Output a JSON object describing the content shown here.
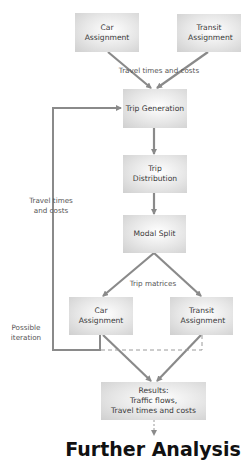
{
  "diagram": {
    "nodes": {
      "car_assignment_top": "Car Assignment",
      "transit_assignment_top": "Transit Assignment",
      "trip_generation": "Trip Generation",
      "trip_distribution": "Trip Distribution",
      "modal_split": "Modal Split",
      "car_assignment_bottom": "Car Assignment",
      "transit_assignment_bottom": "Transit Assignment",
      "results": [
        "Results:",
        "Traffic flows,",
        "Travel times and costs"
      ]
    },
    "labels": {
      "travel_times_top": "Travel times and costs",
      "travel_times_left": [
        "Travel times",
        "and costs"
      ],
      "trip_matrices": "Trip matrices",
      "possible_iteration": [
        "Possible",
        "iteration"
      ]
    },
    "footer_title": "Further Analysis",
    "colors": {
      "box_fill": "#d4d4d4",
      "arrow": "#8a8a8a",
      "text": "#333333"
    }
  }
}
